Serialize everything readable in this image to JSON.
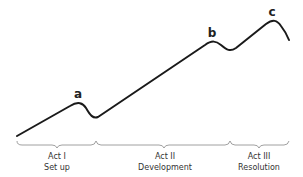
{
  "diagram": {
    "type": "three-act story structure curve",
    "peaks": [
      {
        "label": "a"
      },
      {
        "label": "b"
      },
      {
        "label": "c"
      }
    ],
    "acts": [
      {
        "title": "Act I",
        "subtitle": "Set up"
      },
      {
        "title": "Act II",
        "subtitle": "Development"
      },
      {
        "title": "Act III",
        "subtitle": "Resolution"
      }
    ],
    "colors": {
      "line": "#1a1a1a",
      "brace": "#888888",
      "text": "#333333"
    }
  }
}
